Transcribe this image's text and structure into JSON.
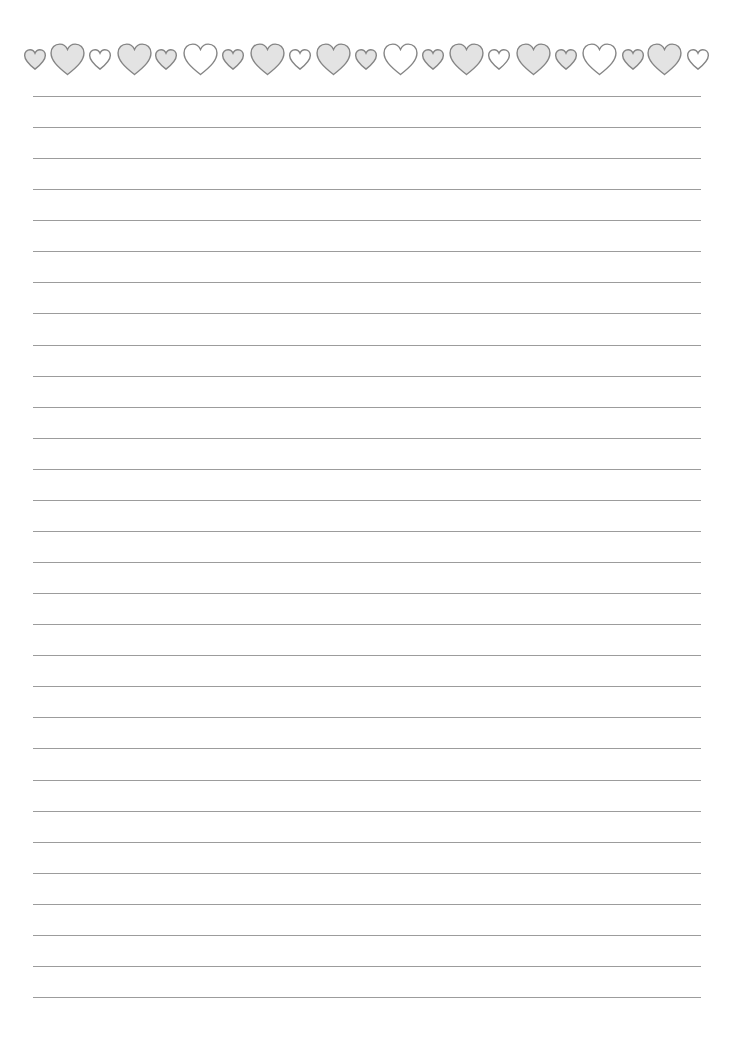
{
  "page": {
    "type": "lined-stationery",
    "background": "#ffffff"
  },
  "border": {
    "icon": "heart-icon",
    "stroke_color": "#858585",
    "gray_fill": "#e3e3e3",
    "white_fill": "#ffffff",
    "hearts": [
      {
        "cx": 35,
        "size": "small",
        "fill": "gray"
      },
      {
        "cx": 67,
        "size": "big",
        "fill": "gray"
      },
      {
        "cx": 100,
        "size": "small",
        "fill": "white"
      },
      {
        "cx": 134,
        "size": "big",
        "fill": "gray"
      },
      {
        "cx": 166,
        "size": "small",
        "fill": "gray"
      },
      {
        "cx": 200,
        "size": "big",
        "fill": "white"
      },
      {
        "cx": 233,
        "size": "small",
        "fill": "gray"
      },
      {
        "cx": 267,
        "size": "big",
        "fill": "gray"
      },
      {
        "cx": 300,
        "size": "small",
        "fill": "white"
      },
      {
        "cx": 333,
        "size": "big",
        "fill": "gray"
      },
      {
        "cx": 366,
        "size": "small",
        "fill": "gray"
      },
      {
        "cx": 400,
        "size": "big",
        "fill": "white"
      },
      {
        "cx": 433,
        "size": "small",
        "fill": "gray"
      },
      {
        "cx": 466,
        "size": "big",
        "fill": "gray"
      },
      {
        "cx": 499,
        "size": "small",
        "fill": "white"
      },
      {
        "cx": 533,
        "size": "big",
        "fill": "gray"
      },
      {
        "cx": 566,
        "size": "small",
        "fill": "gray"
      },
      {
        "cx": 599,
        "size": "big",
        "fill": "white"
      },
      {
        "cx": 633,
        "size": "small",
        "fill": "gray"
      },
      {
        "cx": 664,
        "size": "big",
        "fill": "gray"
      },
      {
        "cx": 698,
        "size": "small",
        "fill": "white"
      }
    ]
  },
  "ruled_lines": {
    "count": 30,
    "first_y": 96,
    "spacing": 31.07,
    "x_start": 33,
    "x_end": 701,
    "color": "#9c9c9c"
  }
}
